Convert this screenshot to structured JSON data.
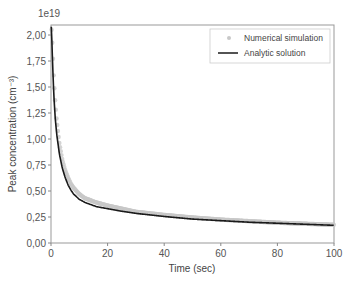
{
  "chart_data": {
    "type": "line",
    "title": "",
    "xlabel": "Time (sec)",
    "ylabel": "Peak concentration (cm⁻³)",
    "y_multiplier_label": "1e19",
    "xlim": [
      0,
      100
    ],
    "ylim": [
      0,
      2.1
    ],
    "xticks": [
      0,
      20,
      40,
      60,
      80,
      100
    ],
    "xtick_labels": [
      "0",
      "20",
      "40",
      "60",
      "80",
      "100"
    ],
    "yticks": [
      0,
      0.25,
      0.5,
      0.75,
      1.0,
      1.25,
      1.5,
      1.75,
      2.0
    ],
    "ytick_labels": [
      "0,00",
      "0,25",
      "0,50",
      "0,75",
      "1,00",
      "1,25",
      "1,50",
      "1,75",
      "2,00"
    ],
    "grid": false,
    "legend_position": "upper right",
    "series": [
      {
        "name": "Numerical simulation",
        "style": "markers",
        "color": "#c8c8c8",
        "x": [
          0.2,
          0.5,
          1,
          1.5,
          2,
          3,
          4,
          5,
          6,
          7,
          8,
          10,
          12,
          14,
          16,
          20,
          25,
          30,
          35,
          40,
          50,
          60,
          70,
          80,
          90,
          100
        ],
        "values": [
          2.05,
          1.9,
          1.58,
          1.35,
          1.18,
          0.95,
          0.8,
          0.7,
          0.63,
          0.57,
          0.53,
          0.47,
          0.43,
          0.41,
          0.39,
          0.36,
          0.33,
          0.3,
          0.285,
          0.27,
          0.245,
          0.225,
          0.21,
          0.195,
          0.185,
          0.175
        ]
      },
      {
        "name": "Analytic solution",
        "style": "line",
        "color": "#1a1a1a",
        "x": [
          0.1,
          0.3,
          0.6,
          1,
          1.5,
          2,
          3,
          4,
          5,
          6,
          7,
          8,
          10,
          12,
          14,
          16,
          20,
          25,
          30,
          35,
          40,
          50,
          60,
          70,
          80,
          90,
          100
        ],
        "values": [
          2.08,
          1.95,
          1.7,
          1.42,
          1.2,
          1.05,
          0.85,
          0.72,
          0.63,
          0.56,
          0.51,
          0.47,
          0.42,
          0.39,
          0.37,
          0.35,
          0.33,
          0.305,
          0.285,
          0.27,
          0.255,
          0.23,
          0.215,
          0.2,
          0.19,
          0.18,
          0.17
        ]
      }
    ]
  }
}
